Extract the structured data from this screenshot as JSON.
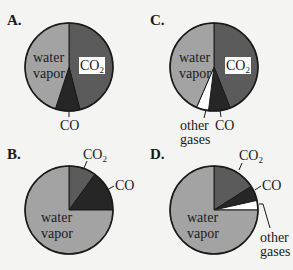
{
  "colors": {
    "co2": "#5b5b5b",
    "co": "#262626",
    "water": "#a3a3a3",
    "other": "#ffffff",
    "outline": "#1a1a1a",
    "background": "#f4f4f2"
  },
  "chart_data": [
    {
      "type": "pie",
      "title": "A.",
      "categories": [
        "CO2",
        "CO",
        "water vapor"
      ],
      "values": [
        0.46,
        0.09,
        0.45
      ],
      "labels": {
        "co2": "CO",
        "co2_sub": "2",
        "co": "CO",
        "water_1": "water",
        "water_2": "vapor"
      }
    },
    {
      "type": "pie",
      "title": "C.",
      "categories": [
        "CO2",
        "CO",
        "other gases",
        "water vapor"
      ],
      "values": [
        0.44,
        0.08,
        0.045,
        0.435
      ],
      "labels": {
        "co2": "CO",
        "co2_sub": "2",
        "co": "CO",
        "other_1": "other",
        "other_2": "gases",
        "water_1": "water",
        "water_2": "vapor"
      }
    },
    {
      "type": "pie",
      "title": "B.",
      "categories": [
        "CO2",
        "CO",
        "water vapor"
      ],
      "values": [
        0.1,
        0.15,
        0.75
      ],
      "labels": {
        "co2": "CO",
        "co2_sub": "2",
        "co": "CO",
        "water_1": "water",
        "water_2": "vapor"
      }
    },
    {
      "type": "pie",
      "title": "D.",
      "categories": [
        "CO2",
        "CO",
        "other gases",
        "water vapor"
      ],
      "values": [
        0.16,
        0.055,
        0.035,
        0.75
      ],
      "labels": {
        "co2": "CO",
        "co2_sub": "2",
        "co": "CO",
        "other_1": "other",
        "other_2": "gases",
        "water_1": "water",
        "water_2": "vapor"
      }
    }
  ]
}
